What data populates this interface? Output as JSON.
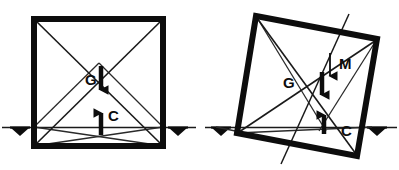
{
  "figure": {
    "background_color": "#ffffff",
    "ink_color": "#0d0d0d",
    "thin_line_color": "#2a2a2a",
    "panels": [
      {
        "id": "upright-block",
        "name": "upright-block-panel",
        "description": "Square block resting flat on the ground with weight G down and reaction C up",
        "square": {
          "name": "block-outline-upright",
          "rotation_deg": 0,
          "corners": [
            {
              "label": "top-left",
              "x": 34,
              "y": 19
            },
            {
              "label": "top-right",
              "x": 163,
              "y": 19
            },
            {
              "label": "bottom-right",
              "x": 163,
              "y": 146
            },
            {
              "label": "bottom-left",
              "x": 34,
              "y": 146
            }
          ],
          "stroke_width": 6
        },
        "diagonals": [
          {
            "name": "diagonal-tl-br",
            "from": [
              34,
              19
            ],
            "to": [
              163,
              146
            ]
          },
          {
            "name": "diagonal-tr-bl",
            "from": [
              163,
              19
            ],
            "to": [
              34,
              146
            ]
          }
        ],
        "fan_lines": [
          {
            "name": "fan-bl-to-ground-right",
            "from": [
              34,
              146
            ],
            "to": [
              163,
              127
            ]
          },
          {
            "name": "fan-br-to-ground-left",
            "from": [
              163,
              146
            ],
            "to": [
              34,
              127
            ]
          },
          {
            "name": "fan-bl-apex",
            "from": [
              34,
              127
            ],
            "to": [
              98,
              62
            ]
          },
          {
            "name": "fan-br-apex",
            "from": [
              163,
              127
            ],
            "to": [
              98,
              62
            ]
          }
        ],
        "ground": {
          "name": "ground-line-upright",
          "y": 127,
          "x_start": 2,
          "x_end": 196,
          "supports": [
            {
              "name": "support-left",
              "x": 20,
              "y": 127
            },
            {
              "name": "support-right",
              "x": 178,
              "y": 127
            }
          ]
        },
        "forces": [
          {
            "name": "force-G-weight",
            "label": "G",
            "label_x": 85,
            "label_y": 84,
            "direction": "down",
            "tail": [
              101,
              66
            ],
            "head": [
              101,
              97
            ],
            "meaning": "weight"
          },
          {
            "name": "force-C-reaction",
            "label": "C",
            "label_x": 110,
            "label_y": 121,
            "direction": "up",
            "tail": [
              101,
              135
            ],
            "head": [
              101,
              106
            ],
            "meaning": "ground reaction"
          }
        ],
        "moment_line": null
      },
      {
        "id": "tilted-block",
        "name": "tilted-block-panel",
        "description": "Same square block tipped over one edge, showing weight G, reaction C and restoring moment M",
        "square": {
          "name": "block-outline-tilted",
          "rotation_deg": 12,
          "corners": [
            {
              "label": "top-left",
              "x": 256,
              "y": 16
            },
            {
              "label": "top-right",
              "x": 377,
              "y": 39
            },
            {
              "label": "bottom-right",
              "x": 357,
              "y": 156
            },
            {
              "label": "bottom-left",
              "x": 237,
              "y": 133
            }
          ],
          "stroke_width": 6
        },
        "diagonals": [
          {
            "name": "diagonal-tl-br",
            "from": [
              256,
              16
            ],
            "to": [
              357,
              156
            ]
          },
          {
            "name": "diagonal-tr-bl",
            "from": [
              377,
              39
            ],
            "to": [
              237,
              133
            ]
          }
        ],
        "fan_lines": [
          {
            "name": "fan-bl-to-br",
            "from": [
              237,
              133
            ],
            "to": [
              357,
              156
            ]
          },
          {
            "name": "fan-bl-to-ground",
            "from": [
              237,
              133
            ],
            "to": [
              372,
              127
            ]
          },
          {
            "name": "fan-ground-to-br",
            "from": [
              216,
              127
            ],
            "to": [
              357,
              156
            ]
          },
          {
            "name": "fan-tl-to-foot",
            "from": [
              256,
              16
            ],
            "to": [
              325,
              130
            ]
          },
          {
            "name": "fan-tr-to-foot",
            "from": [
              377,
              39
            ],
            "to": [
              318,
              130
            ]
          }
        ],
        "ground": {
          "name": "ground-line-tilted",
          "y": 127,
          "x_start": 205,
          "x_end": 397,
          "supports": [
            {
              "name": "support-left",
              "x": 221,
              "y": 127
            },
            {
              "name": "support-right",
              "x": 377,
              "y": 127
            }
          ]
        },
        "forces": [
          {
            "name": "force-M-moment",
            "label": "M",
            "label_x": 343,
            "label_y": 67,
            "direction": "down",
            "tail": [
              330,
              53
            ],
            "head": [
              330,
              85
            ],
            "meaning": "restoring moment arrow"
          },
          {
            "name": "force-G-weight",
            "label": "G",
            "label_x": 285,
            "label_y": 87,
            "direction": "down",
            "tail": [
              322,
              72
            ],
            "head": [
              322,
              102
            ],
            "meaning": "weight"
          },
          {
            "name": "force-C-reaction",
            "label": "C",
            "label_x": 343,
            "label_y": 135,
            "direction": "up",
            "tail": [
              324,
              134
            ],
            "head": [
              324,
              108
            ],
            "meaning": "ground reaction"
          }
        ],
        "moment_line": {
          "name": "moment-axis-line",
          "from": [
            349,
            14
          ],
          "to": [
            281,
            164
          ]
        }
      }
    ]
  }
}
